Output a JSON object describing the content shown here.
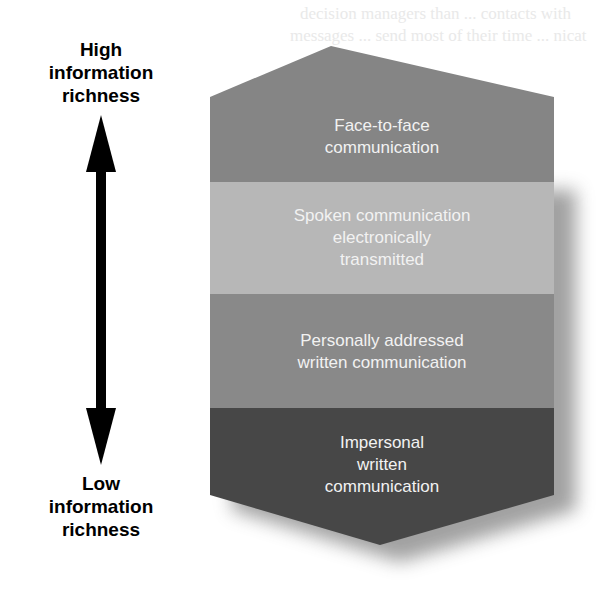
{
  "axis": {
    "top_label": [
      "High",
      "information",
      "richness"
    ],
    "bottom_label": [
      "Low",
      "information",
      "richness"
    ],
    "arrow_icon": "double-headed-vertical-arrow"
  },
  "bands": [
    {
      "lines": [
        "Face-to-face",
        "communication"
      ],
      "color": "#858585"
    },
    {
      "lines": [
        "Spoken communication",
        "electronically",
        "transmitted"
      ],
      "color": "#b7b7b7"
    },
    {
      "lines": [
        "Personally addressed",
        "written communication"
      ],
      "color": "#898989"
    },
    {
      "lines": [
        "Impersonal",
        "written",
        "communication"
      ],
      "color": "#474747"
    }
  ],
  "background_bleed_text": [
    "decision managers than ... contacts with",
    "messages ... send most of their time ... nicat"
  ]
}
